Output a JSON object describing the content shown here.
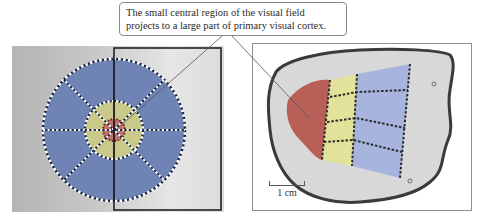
{
  "callout": {
    "line1": "The small central region of the visual field",
    "line2": "projects to a large part of primary visual cortex."
  },
  "left_panel": {
    "description": "visual-field-diagram",
    "regions": [
      "central-fovea",
      "parafoveal-ring",
      "peripheral-ring"
    ]
  },
  "right_panel": {
    "description": "primary-visual-cortex-map",
    "scale_bar": {
      "label": "1 cm"
    }
  },
  "colors": {
    "central": "#b5524a",
    "middle": "#cfcf8a",
    "outer": "#6f84b4",
    "cortex_gray": "#d4d4d4",
    "cortex_outline": "#3a3a3a"
  }
}
